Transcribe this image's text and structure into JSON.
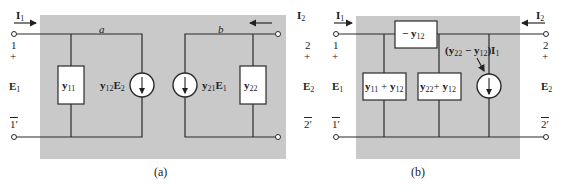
{
  "figure": {
    "panel_a": {
      "caption": "(a)",
      "node_labels": {
        "top_left": "a",
        "top_right": "b"
      },
      "port1": {
        "current": "I",
        "current_sub": "1",
        "terminal_top": "1",
        "terminal_bottom": "1′",
        "plus": "+",
        "minus": "−",
        "voltage": "E",
        "voltage_sub": "1"
      },
      "port2": {
        "current": "I",
        "current_sub": "2",
        "terminal_top": "2",
        "terminal_bottom": "2′",
        "plus": "+",
        "minus": "−",
        "voltage": "E",
        "voltage_sub": "2"
      },
      "elements": [
        {
          "type": "admittance",
          "label": "y",
          "sub": "11"
        },
        {
          "type": "current_source",
          "label": "y",
          "sub": "12",
          "label2": "E",
          "sub2": "2"
        },
        {
          "type": "current_source",
          "label": "y",
          "sub": "21",
          "label2": "E",
          "sub2": "1"
        },
        {
          "type": "admittance",
          "label": "y",
          "sub": "22"
        }
      ]
    },
    "panel_b": {
      "caption": "(b)",
      "port1": {
        "current": "I",
        "current_sub": "1",
        "terminal_top": "1",
        "terminal_bottom": "1′",
        "plus": "+",
        "voltage": "E",
        "voltage_sub": "1"
      },
      "port2": {
        "current": "I",
        "current_sub": "2",
        "terminal_top": "2",
        "terminal_bottom": "2′",
        "plus": "+",
        "voltage": "E",
        "voltage_sub": "2"
      },
      "elements": [
        {
          "type": "admittance",
          "label": "− y",
          "sub": "12"
        },
        {
          "type": "admittance",
          "label": "y",
          "sub": "11",
          "plus": "+ y",
          "sub2": "12"
        },
        {
          "type": "admittance",
          "label": "y",
          "sub": "22",
          "plus": "+ y",
          "sub2": "12"
        },
        {
          "type": "current_source",
          "label": "(y",
          "sub": "22",
          "mid": " − y",
          "sub2": "12",
          "tail": ")I",
          "sub3": "1"
        }
      ]
    },
    "colors": {
      "panel": "#c9c9c9",
      "wire": "#2a2a2a",
      "box_fill": "#ffffff"
    }
  }
}
